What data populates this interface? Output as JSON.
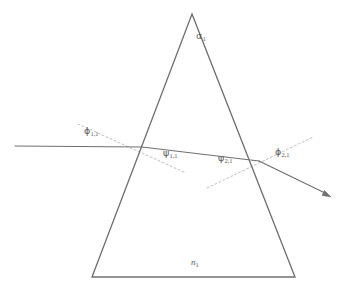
{
  "figure": {
    "type": "optical-ray-diagram",
    "background_color": "#ffffff",
    "canvas": {
      "width": 344,
      "height": 292
    }
  },
  "colors": {
    "prism_outline": "#6f6f6f",
    "ray": "#707070",
    "normal_dotted": "#c9c9c9",
    "label_text": "#5a5a5a"
  },
  "prism": {
    "name": "triangular-prism",
    "apex": {
      "x": 192,
      "y": 14
    },
    "bottom_left": {
      "x": 92,
      "y": 277
    },
    "bottom_right": {
      "x": 295,
      "y": 277
    },
    "stroke_width": 1.3
  },
  "labels": {
    "apex_angle": {
      "symbol": "α",
      "subscript": "1",
      "text": "α₁",
      "x": 196,
      "y": 36
    },
    "refractive_index": {
      "symbol": "n",
      "subscript": "1",
      "text": "n₁",
      "x": 191,
      "y": 262,
      "italic": true
    },
    "incidence_angle_1": {
      "symbol": "ϕ",
      "subscript": "1,1",
      "text": "ϕ₁,₁",
      "x": 84,
      "y": 130
    },
    "refraction_angle_1": {
      "symbol": "ψ",
      "subscript": "1,1",
      "text": "ψ₁,₁",
      "x": 163,
      "y": 152
    },
    "incidence_angle_2": {
      "symbol": "ψ",
      "subscript": "2,1",
      "text": "ψ₂,₁",
      "x": 218,
      "y": 157
    },
    "exit_angle_2": {
      "symbol": "ϕ",
      "subscript": "2,1",
      "text": "ϕ₂,₁",
      "x": 275,
      "y": 151
    }
  },
  "rays": {
    "incident": {
      "name": "incident-ray",
      "from": {
        "x": 15,
        "y": 146
      },
      "to": {
        "x": 142,
        "y": 147
      }
    },
    "internal": {
      "name": "internal-refracted-ray",
      "from": {
        "x": 142,
        "y": 147
      },
      "to": {
        "x": 259,
        "y": 161
      }
    },
    "emergent": {
      "name": "emergent-ray",
      "from": {
        "x": 259,
        "y": 161
      },
      "to": {
        "x": 330,
        "y": 196
      },
      "arrowhead": true
    }
  },
  "normals": [
    {
      "name": "surface-normal-entry",
      "style": "dotted",
      "from": {
        "x": 78,
        "y": 124
      },
      "to": {
        "x": 186,
        "y": 173
      }
    },
    {
      "name": "surface-normal-exit",
      "style": "dotted",
      "from": {
        "x": 207,
        "y": 188
      },
      "to": {
        "x": 313,
        "y": 137
      }
    }
  ]
}
